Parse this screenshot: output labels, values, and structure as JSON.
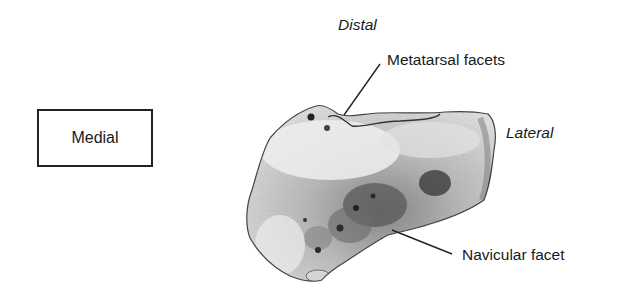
{
  "figure": {
    "orientation_labels": {
      "distal": "Distal",
      "lateral": "Lateral",
      "medial": "Medial"
    },
    "annotations": {
      "metatarsal": "Metatarsal facets",
      "navicular": "Navicular facet"
    },
    "colors": {
      "text": "#1a1a1a",
      "line": "#222222",
      "bone_light": "#e6e6e6",
      "bone_mid": "#a8a8a8",
      "bone_dark": "#4a4a4a"
    }
  }
}
